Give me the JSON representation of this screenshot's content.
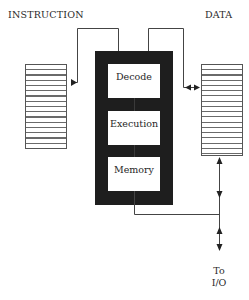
{
  "diagram": {
    "type": "pipeline-architecture",
    "titles": {
      "instruction": "INSTRUCTION",
      "data": "DATA"
    },
    "stages": [
      {
        "label": "Decode"
      },
      {
        "label": "Execution"
      },
      {
        "label": "Memory"
      }
    ],
    "io": {
      "line1": "To",
      "line2": "I/O"
    },
    "colors": {
      "block": "#1e1e1e",
      "line": "#444444",
      "background": "#ffffff"
    }
  }
}
